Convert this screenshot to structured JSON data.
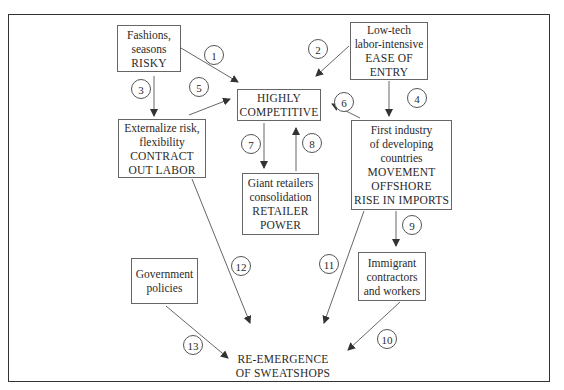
{
  "diagram": {
    "nodes": {
      "fashions": {
        "lines": [
          "Fashions,",
          "seasons",
          "RISKY"
        ]
      },
      "lowtech": {
        "lines": [
          "Low-tech",
          "labor-intensive",
          "EASE OF",
          "ENTRY"
        ]
      },
      "competitive": {
        "lines": [
          "HIGHLY",
          "COMPETITIVE"
        ]
      },
      "externalize": {
        "lines": [
          "Externalize risk,",
          "flexibility",
          "CONTRACT",
          "OUT LABOR"
        ]
      },
      "first_industry": {
        "lines": [
          "First industry",
          "of developing",
          "countries",
          "MOVEMENT",
          "OFFSHORE",
          "RISE IN IMPORTS"
        ]
      },
      "retailers": {
        "lines": [
          "Giant retailers",
          "consolidation",
          "RETAILER",
          "POWER"
        ]
      },
      "immigrant": {
        "lines": [
          "Immigrant",
          "contractors",
          "and workers"
        ]
      },
      "government": {
        "lines": [
          "Government",
          "policies"
        ]
      },
      "sweatshops": {
        "lines": [
          "RE-EMERGENCE",
          "OF SWEATSHOPS"
        ]
      }
    },
    "edges": [
      {
        "label": "1",
        "from": "fashions",
        "to": "competitive"
      },
      {
        "label": "2",
        "from": "lowtech",
        "to": "competitive"
      },
      {
        "label": "3",
        "from": "fashions",
        "to": "externalize"
      },
      {
        "label": "4",
        "from": "lowtech",
        "to": "first_industry"
      },
      {
        "label": "5",
        "from": "externalize",
        "to": "competitive"
      },
      {
        "label": "6",
        "from": "first_industry",
        "to": "competitive"
      },
      {
        "label": "7",
        "from": "competitive",
        "to": "retailers"
      },
      {
        "label": "8",
        "from": "retailers",
        "to": "competitive"
      },
      {
        "label": "9",
        "from": "first_industry",
        "to": "immigrant"
      },
      {
        "label": "10",
        "from": "immigrant",
        "to": "sweatshops"
      },
      {
        "label": "11",
        "from": "first_industry",
        "to": "sweatshops"
      },
      {
        "label": "12",
        "from": "externalize",
        "to": "sweatshops"
      },
      {
        "label": "13",
        "from": "government",
        "to": "sweatshops"
      }
    ],
    "colors": {
      "line": "#444444",
      "border": "#666666",
      "text": "#2a2a2a"
    }
  }
}
